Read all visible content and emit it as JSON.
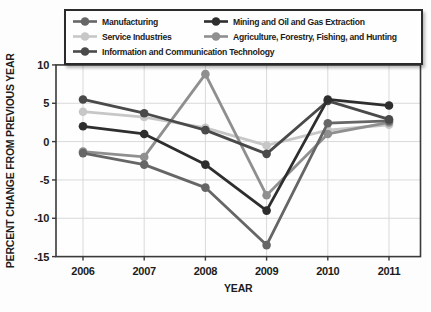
{
  "chart_data": {
    "type": "line",
    "title": "",
    "xlabel": "YEAR",
    "ylabel": "PERCENT CHANGE FROM PREVIOUS YEAR",
    "x": [
      2006,
      2007,
      2008,
      2009,
      2010,
      2011
    ],
    "x_tick_labels": [
      "2006",
      "2007",
      "2008",
      "2009",
      "2010",
      "2011"
    ],
    "yticks": [
      10,
      5,
      0,
      -5,
      -10,
      -15
    ],
    "y_tick_labels": [
      "10",
      "5",
      "0",
      "-5",
      "-10",
      "-15"
    ],
    "ylim": [
      -15,
      10
    ],
    "grid": true,
    "legend_position": "top",
    "series": [
      {
        "name": "Manufacturing",
        "color": "#666666",
        "values": [
          -1.5,
          -3,
          -6,
          -13.5,
          2.4,
          2.7
        ]
      },
      {
        "name": "Mining and Oil and Gas Extraction",
        "color": "#2e2e2e",
        "values": [
          2,
          1,
          -3,
          -9,
          5.5,
          4.7
        ]
      },
      {
        "name": "Service Industries",
        "color": "#c7c7c7",
        "values": [
          3.9,
          3.2,
          1.8,
          -0.5,
          1.5,
          2.2
        ]
      },
      {
        "name": "Agriculture, Forestry, Fishing, and Hunting",
        "color": "#8f8f8f",
        "values": [
          -1.3,
          -2,
          8.8,
          -7,
          1,
          2.5
        ]
      },
      {
        "name": "Information and Communication Technology",
        "color": "#4a4a4a",
        "values": [
          5.5,
          3.7,
          1.5,
          -1.6,
          5.3,
          2.9
        ]
      }
    ],
    "legend_order": [
      0,
      1,
      2,
      3,
      4
    ],
    "draw_order": [
      2,
      3,
      0,
      4,
      1
    ]
  },
  "style": {
    "grid_color": "#d9d9d9",
    "frame_color": "#3a3a3a",
    "tick_color": "#3a3a3a"
  }
}
